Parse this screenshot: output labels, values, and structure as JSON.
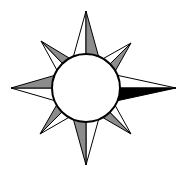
{
  "figure": {
    "title": "",
    "kind": "compass-rose",
    "colors": {
      "background": "#ffffff",
      "outline": "#000000",
      "light": "#ffffff",
      "shade": "#8c8c8c",
      "dark": "#000000"
    },
    "center": [
      86,
      88
    ],
    "circle_radius": 34,
    "points": [
      {
        "name": "north",
        "tip": [
          86,
          11
        ],
        "left_fill": "light",
        "right_fill": "shade"
      },
      {
        "name": "east",
        "tip": [
          176,
          88
        ],
        "left_fill": "light",
        "right_fill": "dark"
      },
      {
        "name": "south",
        "tip": [
          86,
          165
        ],
        "left_fill": "light",
        "right_fill": "shade"
      },
      {
        "name": "west",
        "tip": [
          11,
          88
        ],
        "left_fill": "light",
        "right_fill": "shade"
      },
      {
        "name": "northeast",
        "tip": [
          131,
          43
        ],
        "left_fill": "light",
        "right_fill": "shade"
      },
      {
        "name": "southeast",
        "tip": [
          131,
          134
        ],
        "left_fill": "light",
        "right_fill": "shade"
      },
      {
        "name": "southwest",
        "tip": [
          40,
          134
        ],
        "left_fill": "light",
        "right_fill": "shade"
      },
      {
        "name": "northwest",
        "tip": [
          41,
          41
        ],
        "left_fill": "light",
        "right_fill": "shade"
      }
    ]
  }
}
